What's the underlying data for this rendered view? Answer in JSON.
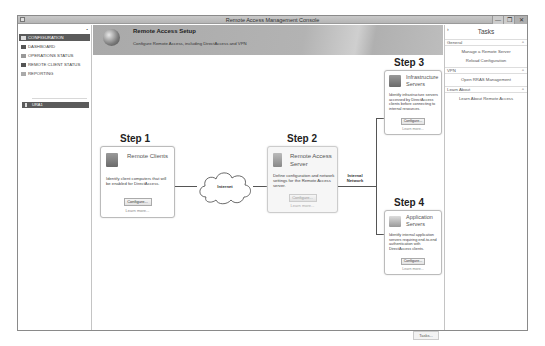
{
  "window": {
    "title": "Remote Access Management Console",
    "controls": {
      "minimize": "—",
      "restore": "❐",
      "close": "✕"
    }
  },
  "nav": {
    "items": [
      {
        "label": "CONFIGURATION",
        "icon": "configuration-icon",
        "selected": true
      },
      {
        "label": "DASHBOARD",
        "icon": "dashboard-icon",
        "selected": false
      },
      {
        "label": "OPERATIONS STATUS",
        "icon": "operations-status-icon",
        "selected": false
      },
      {
        "label": "REMOTE CLIENT STATUS",
        "icon": "remote-client-status-icon",
        "selected": false
      },
      {
        "label": "REPORTING",
        "icon": "reporting-icon",
        "selected": false
      }
    ],
    "server": {
      "label": "URA1",
      "icon": "server-icon"
    }
  },
  "banner": {
    "title": "Remote Access Setup",
    "subtitle": "Configure Remote Access, including DirectAccess and VPN"
  },
  "steps": [
    {
      "label": "Step 1",
      "title": "Remote Clients",
      "description": "Identify client computers that will be enabled for DirectAccess.",
      "button": "Configure...",
      "link": "Learn more...",
      "enabled": true
    },
    {
      "label": "Step 2",
      "title": "Remote Access Server",
      "description": "Define configuration and network settings for the Remote Access server.",
      "button": "Configure...",
      "link": "Learn more...",
      "enabled": false
    },
    {
      "label": "Step 3",
      "title": "Infrastructure Servers",
      "description": "Identify infrastructure servers accessed by DirectAccess clients before connecting to internal resources.",
      "button": "Configure...",
      "link": "Learn more...",
      "enabled": true
    },
    {
      "label": "Step 4",
      "title": "Application Servers",
      "description": "Identify internal application servers requiring end-to-end authentication with DirectAccess clients.",
      "button": "Configure...",
      "link": "Learn more...",
      "enabled": true
    }
  ],
  "network": {
    "internet": "Internet",
    "internal": "Internal Network"
  },
  "footer": {
    "tasks_button": "Tasks..."
  },
  "tasks": {
    "header": "Tasks",
    "collapse_glyph": "›",
    "sections": [
      {
        "title": "General",
        "items": [
          "Manage a Remote Server",
          "Reload Configuration"
        ]
      },
      {
        "title": "VPN",
        "items": [
          "Open RRAS Management"
        ]
      },
      {
        "title": "Learn About",
        "items": [
          "Learn About Remote Access"
        ]
      }
    ]
  }
}
